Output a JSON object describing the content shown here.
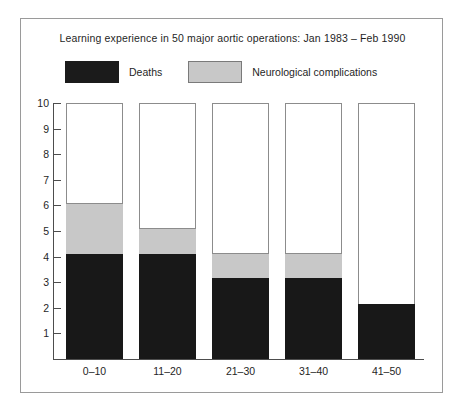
{
  "chart_data": {
    "type": "bar",
    "subtype": "stacked-bar",
    "title": "Learning experience in 50 major aortic operations: Jan 1983 – Feb 1990",
    "xlabel": "",
    "ylabel": "",
    "ylim": [
      0,
      10
    ],
    "y_ticks": [
      1,
      2,
      3,
      4,
      5,
      6,
      7,
      8,
      9,
      10
    ],
    "grid": false,
    "legend_position": "top",
    "categories": [
      "0–10",
      "11–20",
      "21–30",
      "31–40",
      "41–50"
    ],
    "series": [
      {
        "name": "Deaths",
        "color": "#181818",
        "values": [
          4.1,
          4.1,
          3.15,
          3.15,
          2.15
        ]
      },
      {
        "name": "Neurological complications",
        "color": "#c8c8c8",
        "values": [
          2.0,
          1.0,
          1.0,
          1.0,
          0
        ]
      }
    ],
    "stack_tops": [
      6.1,
      5.1,
      4.15,
      4.15,
      2.15
    ],
    "bar_max_outline": 10
  },
  "legend": {
    "entries": [
      {
        "label": "Deaths",
        "swatch": "dark-swatch"
      },
      {
        "label": "Neurological complications",
        "swatch": "light-gray-swatch"
      }
    ]
  },
  "colors": {
    "deaths": "#181818",
    "neurological": "#c8c8c8",
    "axis": "#4d4d4d",
    "frame": "#9a9a9a",
    "bar_outline": "#8c8c8c",
    "text": "#1f1f1f",
    "background": "#ffffff"
  }
}
